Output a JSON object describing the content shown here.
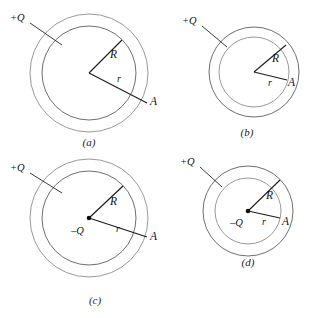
{
  "figure": {
    "background_color": "#ffffff",
    "width": 316,
    "height": 318,
    "panel_count": 4
  },
  "labels": {
    "plus_q": "+Q",
    "minus_q": "–Q",
    "radius_big": "R",
    "radius_small": "r",
    "point_a": "A"
  },
  "colors": {
    "outer_shell_light": "#d7d7d7",
    "outer_shell_mid": "#c3c3c3",
    "outer_shell_dark": "#b0b0b0",
    "inner_sphere_dark": "#a9a9a9",
    "inner_sphere_light": "#d9d9d9",
    "inner_sphere_pale": "#e2e2e2",
    "outline": "#8d8d8d",
    "line": "#1b1b1b",
    "text": "#111111"
  },
  "panels": [
    {
      "id": "a",
      "caption": "(a)",
      "outer_label": "+Q",
      "center_label": null,
      "center_dot": false,
      "radius_big_label": "R",
      "radius_small_label": "r",
      "point_label": "A",
      "outer_radius_px": 60,
      "inner_radius_px": 48,
      "shell_tone": "light",
      "core_tone": "dark",
      "description": "Uniformly charged solid sphere of radius R inside a larger light shell; point A lies outside at distance r."
    },
    {
      "id": "b",
      "caption": "(b)",
      "outer_label": "+Q",
      "center_label": null,
      "center_dot": false,
      "radius_big_label": "R",
      "radius_small_label": "r",
      "point_label": "A",
      "outer_radius_px": 45,
      "inner_radius_px": 35,
      "shell_tone": "dark",
      "core_tone": "light",
      "description": "Charged shell of outer radius R with a lighter interior; point A lies at radius r inside the shell."
    },
    {
      "id": "c",
      "caption": "(c)",
      "outer_label": "+Q",
      "center_label": "–Q",
      "center_dot": true,
      "radius_big_label": "R",
      "radius_small_label": "r",
      "point_label": "A",
      "outer_radius_px": 60,
      "inner_radius_px": 48,
      "shell_tone": "light",
      "core_tone": "dark",
      "description": "Point charge –Q at the centre of a solid sphere inside a +Q shell; point A lies outside at distance r."
    },
    {
      "id": "d",
      "caption": "(d)",
      "outer_label": "+Q",
      "center_label": "–Q",
      "center_dot": true,
      "radius_big_label": "R",
      "radius_small_label": "r",
      "point_label": "A",
      "outer_radius_px": 45,
      "inner_radius_px": 33,
      "shell_tone": "dark",
      "core_tone": "pale",
      "description": "Point charge –Q at the centre of a pale cavity enclosed by a +Q shell; point A lies at radius r."
    }
  ]
}
